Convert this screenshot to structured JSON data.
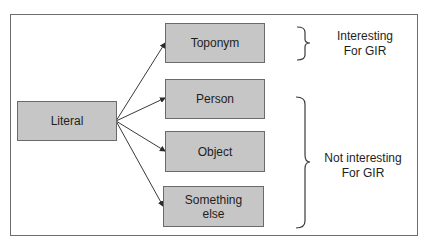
{
  "diagram": {
    "source": {
      "label": "Literal"
    },
    "targets": [
      {
        "label": "Toponym"
      },
      {
        "label": "Person"
      },
      {
        "label": "Object"
      },
      {
        "label": "Something else"
      }
    ],
    "groups": [
      {
        "label_line1": "Interesting",
        "label_line2": "For GIR",
        "members": [
          "Toponym"
        ]
      },
      {
        "label_line1": "Not interesting",
        "label_line2": "For GIR",
        "members": [
          "Person",
          "Object",
          "Something else"
        ]
      }
    ],
    "colors": {
      "box_fill": "#c6c6c6",
      "box_border": "#6a6a6a",
      "line": "#3a3a3a",
      "text": "#1e1e1e"
    }
  }
}
